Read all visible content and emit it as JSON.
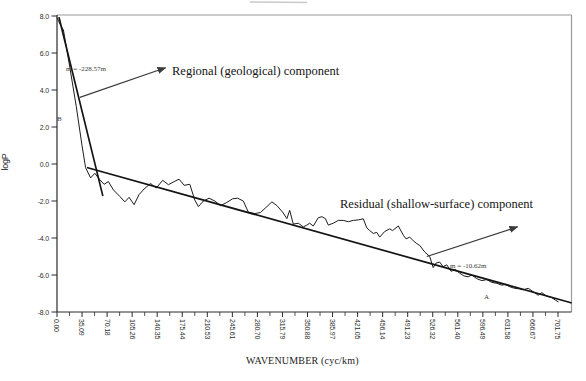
{
  "figure": {
    "ylabel": "logP",
    "xlabel": "WAVENUMBER (cyc/km)",
    "annotations": {
      "regional_label": "Regional (geological) component",
      "residual_label": "Residual (shallow-surface) component",
      "regional_slope": "m = -228.57m",
      "residual_slope": "m = -10.62m",
      "point_a": "A",
      "point_b": "B"
    },
    "colors": {
      "background": "#ffffff",
      "curve": "#1c1c1c",
      "fit_line": "#141414",
      "axis": "#2b2b2b",
      "frame": "#9a9a9a",
      "arrow": "#3a3a3a",
      "scan_artifact": "#c9c9c9"
    }
  },
  "chart_data": {
    "type": "line",
    "title": "",
    "xlabel": "WAVENUMBER (cyc/km)",
    "ylabel": "logP",
    "xlim": [
      0,
      701.75
    ],
    "ylim": [
      -8.0,
      8.0
    ],
    "grid": false,
    "legend": "none",
    "x_tick_step": 35.0875,
    "x_minor_tick_step": 17.54375,
    "x_tick_labels": [
      "0.00",
      "35.09",
      "70.18",
      "105.26",
      "140.35",
      "175.44",
      "210.53",
      "245.61",
      "280.70",
      "315.79",
      "350.88",
      "385.97",
      "421.05",
      "456.14",
      "491.23",
      "526.32",
      "561.40",
      "596.49",
      "631.58",
      "666.67",
      "701.75"
    ],
    "y_tick_labels": [
      "8.0",
      "6.0",
      "4.0",
      "2.0",
      "0.0",
      "-2.0",
      "-4.0",
      "-6.0",
      "-8.0"
    ],
    "y_tick_values": [
      8.0,
      6.0,
      4.0,
      2.0,
      0.0,
      -2.0,
      -4.0,
      -6.0,
      -8.0
    ],
    "series": [
      {
        "name": "power-spectrum",
        "role": "data",
        "points": [
          [
            0,
            7.9
          ],
          [
            5,
            7.5
          ],
          [
            9,
            7.25
          ],
          [
            18,
            5.2
          ],
          [
            27,
            3.1
          ],
          [
            35,
            1.0
          ],
          [
            40,
            -0.2
          ],
          [
            47,
            -0.75
          ],
          [
            53,
            -0.5
          ],
          [
            60,
            -0.85
          ],
          [
            66,
            -1.1
          ],
          [
            72,
            -0.95
          ],
          [
            79,
            -1.4
          ],
          [
            88,
            -1.75
          ],
          [
            95,
            -2.05
          ],
          [
            101,
            -1.8
          ],
          [
            108,
            -2.2
          ],
          [
            115,
            -1.65
          ],
          [
            122,
            -1.35
          ],
          [
            131,
            -1.05
          ],
          [
            139,
            -1.3
          ],
          [
            148,
            -0.88
          ],
          [
            156,
            -1.12
          ],
          [
            164,
            -0.95
          ],
          [
            171,
            -0.82
          ],
          [
            178,
            -1.15
          ],
          [
            186,
            -1.1
          ],
          [
            193,
            -1.95
          ],
          [
            198,
            -2.3
          ],
          [
            205,
            -2.0
          ],
          [
            213,
            -1.85
          ],
          [
            221,
            -2.0
          ],
          [
            229,
            -2.25
          ],
          [
            237,
            -2.1
          ],
          [
            246,
            -1.88
          ],
          [
            253,
            -1.85
          ],
          [
            261,
            -2.0
          ],
          [
            268,
            -2.6
          ],
          [
            277,
            -2.68
          ],
          [
            285,
            -2.62
          ],
          [
            294,
            -2.3
          ],
          [
            301,
            -2.05
          ],
          [
            308,
            -2.25
          ],
          [
            316,
            -2.6
          ],
          [
            322,
            -2.95
          ],
          [
            326,
            -2.5
          ],
          [
            331,
            -3.25
          ],
          [
            338,
            -3.2
          ],
          [
            345,
            -3.4
          ],
          [
            350,
            -3.3
          ],
          [
            354,
            -3.2
          ],
          [
            359,
            -3.35
          ],
          [
            366,
            -2.9
          ],
          [
            371,
            -2.85
          ],
          [
            376,
            -2.95
          ],
          [
            380,
            -3.3
          ],
          [
            387,
            -3.2
          ],
          [
            394,
            -3.05
          ],
          [
            401,
            -3.05
          ],
          [
            408,
            -3.12
          ],
          [
            415,
            -3.05
          ],
          [
            422,
            -3.02
          ],
          [
            429,
            -2.96
          ],
          [
            434,
            -3.45
          ],
          [
            438,
            -3.6
          ],
          [
            443,
            -3.75
          ],
          [
            448,
            -3.7
          ],
          [
            452,
            -3.95
          ],
          [
            459,
            -3.65
          ],
          [
            466,
            -3.5
          ],
          [
            470,
            -3.6
          ],
          [
            478,
            -3.35
          ],
          [
            485,
            -3.85
          ],
          [
            489,
            -4.05
          ],
          [
            494,
            -3.95
          ],
          [
            499,
            -4.15
          ],
          [
            504,
            -4.3
          ],
          [
            508,
            -4.4
          ],
          [
            515,
            -4.75
          ],
          [
            522,
            -5.0
          ],
          [
            527,
            -5.6
          ],
          [
            531,
            -5.35
          ],
          [
            536,
            -5.3
          ],
          [
            541,
            -5.55
          ],
          [
            546,
            -5.45
          ],
          [
            552,
            -5.8
          ],
          [
            558,
            -5.7
          ],
          [
            564,
            -5.9
          ],
          [
            570,
            -6.05
          ],
          [
            576,
            -6.1
          ],
          [
            581,
            -6.0
          ],
          [
            588,
            -6.2
          ],
          [
            595,
            -6.3
          ],
          [
            602,
            -6.25
          ],
          [
            609,
            -6.4
          ],
          [
            616,
            -6.45
          ],
          [
            623,
            -6.55
          ],
          [
            628,
            -6.5
          ],
          [
            635,
            -6.65
          ],
          [
            641,
            -6.72
          ],
          [
            648,
            -6.75
          ],
          [
            653,
            -6.8
          ],
          [
            660,
            -6.72
          ],
          [
            667,
            -6.9
          ],
          [
            674,
            -7.1
          ],
          [
            679,
            -6.95
          ],
          [
            686,
            -7.15
          ],
          [
            692,
            -7.2
          ],
          [
            698,
            -7.35
          ],
          [
            702,
            -7.45
          ]
        ]
      },
      {
        "name": "regional-fit",
        "role": "fit",
        "slope_label": "m = -228.57m",
        "points": [
          [
            3,
            7.9
          ],
          [
            64,
            -1.7
          ]
        ]
      },
      {
        "name": "residual-fit",
        "role": "fit",
        "slope_label": "m = -10.62m",
        "points": [
          [
            43,
            -0.2
          ],
          [
            720,
            -7.5
          ]
        ]
      }
    ],
    "arrows": [
      {
        "name": "regional-arrow",
        "from": [
          32,
          3.6
        ],
        "to": [
          152,
          5.2
        ]
      },
      {
        "name": "residual-arrow",
        "from": [
          518,
          -5.0
        ],
        "to": [
          645,
          -3.4
        ]
      }
    ]
  }
}
